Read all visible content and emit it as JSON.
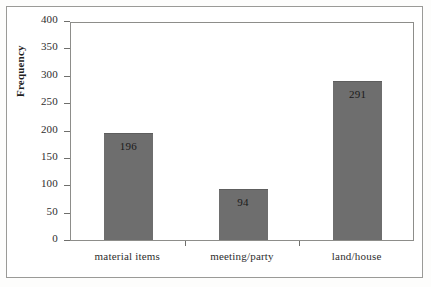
{
  "chart_data": {
    "type": "bar",
    "title": "",
    "subtitle": "",
    "xlabel": "",
    "ylabel": "Frequency",
    "categories": [
      "material items",
      "meeting/party",
      "land/house"
    ],
    "values": [
      196,
      94,
      291
    ],
    "data_labels": [
      "196",
      "94",
      "291"
    ],
    "series": [
      {
        "name": "Frequency",
        "values": [
          196,
          94,
          291
        ]
      }
    ],
    "ylim": [
      0,
      400
    ],
    "ytick_labels": [
      "400",
      "350",
      "300",
      "250",
      "200",
      "150",
      "100",
      "50",
      "0"
    ],
    "ytick_values": [
      400,
      350,
      300,
      250,
      200,
      150,
      100,
      50,
      0
    ],
    "grid": false,
    "legend": false,
    "legend_position": "none",
    "bar_color": "#6e6e6e",
    "axis_color": "#8d8d8a",
    "background_color": "#ffffff",
    "frame_color": "#9a9a97"
  }
}
